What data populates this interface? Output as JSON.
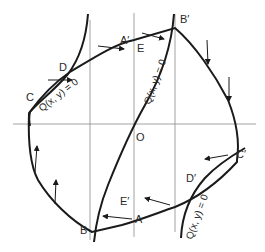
{
  "diagram": {
    "colors": {
      "curve": "#1a1a1a",
      "axis": "#8c8c8c",
      "text": "#2a2a2a",
      "background": "#ffffff"
    },
    "points": {
      "A": "A",
      "A_prime": "A′",
      "B": "B",
      "B_prime": "B′",
      "C": "C",
      "C_prime": "C′",
      "D": "D",
      "D_prime": "D′",
      "E": "E",
      "E_prime": "E′",
      "O": "O"
    },
    "isocline_labels": {
      "left": "Q(x, y) = 0",
      "center": "Q(x, y) = 0",
      "right": "Q(x, y) = 0"
    }
  }
}
